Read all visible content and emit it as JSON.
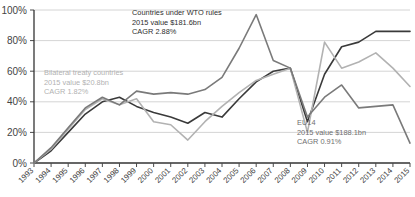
{
  "chart_data": {
    "type": "line",
    "title": "",
    "xlabel": "",
    "ylabel": "",
    "ylim": [
      0,
      100
    ],
    "ytick_labels": [
      "100%",
      "80%",
      "60%",
      "40%",
      "20%",
      "0%"
    ],
    "ytick_values": [
      100,
      80,
      60,
      40,
      20,
      0
    ],
    "grid": true,
    "legend_position": "inline-annotations",
    "x": [
      1993,
      1994,
      1995,
      1996,
      1997,
      1998,
      1999,
      2000,
      2001,
      2002,
      2003,
      2004,
      2005,
      2006,
      2007,
      2008,
      2009,
      2010,
      2011,
      2012,
      2013,
      2014,
      2015
    ],
    "categories": [
      "1993",
      "1994",
      "1995",
      "1996",
      "1997",
      "1998",
      "1999",
      "2000",
      "2001",
      "2002",
      "2003",
      "2004",
      "2005",
      "2006",
      "2007",
      "2008",
      "2009",
      "2010",
      "2011",
      "2012",
      "2013",
      "2014",
      "2015"
    ],
    "series": [
      {
        "name": "Countries under WTO rules",
        "color": "#3a3a3a",
        "values": [
          0,
          8,
          20,
          32,
          40,
          43,
          37,
          33,
          30,
          26,
          33,
          30,
          42,
          53,
          60,
          62,
          27,
          58,
          76,
          79,
          86,
          86,
          86
        ]
      },
      {
        "name": "Bilateral treaty countries",
        "color": "#b2b2b2",
        "values": [
          0,
          9,
          22,
          35,
          42,
          38,
          42,
          27,
          25,
          15,
          27,
          37,
          46,
          54,
          58,
          62,
          20,
          79,
          62,
          66,
          72,
          62,
          50
        ]
      },
      {
        "name": "EU14",
        "color": "#7a7a7a",
        "values": [
          0,
          10,
          23,
          36,
          43,
          38,
          47,
          45,
          46,
          45,
          48,
          56,
          75,
          97,
          67,
          62,
          30,
          43,
          51,
          36,
          37,
          38,
          13
        ]
      }
    ],
    "annotations": [
      {
        "id": "wto",
        "label": "Countries under WTO rules",
        "value_line": "2015 value $181.6bn",
        "cagr_line": "CAGR 2.88%",
        "color": "#2e2e2e"
      },
      {
        "id": "bilateral",
        "label": "Bilateral treaty countries",
        "value_line": "2015 value $20.8bn",
        "cagr_line": "CAGR 1.82%",
        "color": "#b2b2b2"
      },
      {
        "id": "eu14",
        "label": "EU14",
        "value_line": "2015 value $188.1bn",
        "cagr_line": "CAGR 0.91%",
        "color": "#6f6f6f"
      }
    ]
  },
  "axes": {
    "x_min": 1993,
    "x_max": 2015,
    "y_min": 0,
    "y_max": 100
  }
}
